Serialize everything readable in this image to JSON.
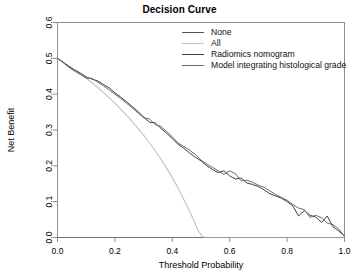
{
  "chart_data": {
    "type": "line",
    "title": "Decision Curve",
    "xlabel": "Threshold Probability",
    "ylabel": "Net Benefit",
    "xlim": [
      0.0,
      1.0
    ],
    "ylim": [
      0.0,
      0.6
    ],
    "xticks": [
      "0.0",
      "0.2",
      "0.4",
      "0.6",
      "0.8",
      "1.0"
    ],
    "xtickvals": [
      0.0,
      0.2,
      0.4,
      0.6,
      0.8,
      1.0
    ],
    "yticks": [
      "0.0",
      "0.1",
      "0.2",
      "0.3",
      "0.4",
      "0.5",
      "0.6"
    ],
    "ytickvals": [
      0.0,
      0.1,
      0.2,
      0.3,
      0.4,
      0.5,
      0.6
    ],
    "grid": false,
    "legend_position": "top-right",
    "series": [
      {
        "name": "None",
        "color": "#555555",
        "width": 1.1,
        "x": [
          0.0,
          1.0
        ],
        "y": [
          0.0,
          0.0
        ]
      },
      {
        "name": "All",
        "color": "#c2c2c2",
        "width": 1.1,
        "x": [
          0.0,
          0.05,
          0.1,
          0.15,
          0.2,
          0.25,
          0.3,
          0.33,
          0.36,
          0.39,
          0.42,
          0.45,
          0.47,
          0.49,
          0.505,
          0.515,
          1.0
        ],
        "y": [
          0.5,
          0.47,
          0.445,
          0.412,
          0.375,
          0.333,
          0.286,
          0.254,
          0.219,
          0.181,
          0.138,
          0.091,
          0.056,
          0.02,
          0.002,
          0.0,
          0.0
        ]
      },
      {
        "name": "Radiomics nomogram",
        "color": "#3f3f3f",
        "width": 1.0,
        "x": [
          0.0,
          0.02,
          0.04,
          0.06,
          0.08,
          0.1,
          0.12,
          0.14,
          0.16,
          0.18,
          0.2,
          0.22,
          0.24,
          0.26,
          0.28,
          0.3,
          0.32,
          0.34,
          0.36,
          0.38,
          0.4,
          0.42,
          0.44,
          0.46,
          0.48,
          0.5,
          0.52,
          0.54,
          0.56,
          0.58,
          0.6,
          0.62,
          0.64,
          0.66,
          0.68,
          0.7,
          0.72,
          0.74,
          0.76,
          0.78,
          0.8,
          0.82,
          0.84,
          0.86,
          0.88,
          0.9,
          0.92,
          0.94,
          0.96,
          0.98,
          1.0
        ],
        "y": [
          0.5,
          0.489,
          0.478,
          0.468,
          0.459,
          0.448,
          0.442,
          0.437,
          0.427,
          0.418,
          0.404,
          0.392,
          0.379,
          0.366,
          0.352,
          0.336,
          0.322,
          0.32,
          0.305,
          0.291,
          0.276,
          0.26,
          0.249,
          0.236,
          0.224,
          0.214,
          0.2,
          0.19,
          0.181,
          0.186,
          0.172,
          0.163,
          0.166,
          0.152,
          0.148,
          0.142,
          0.133,
          0.122,
          0.116,
          0.11,
          0.1,
          0.088,
          0.06,
          0.075,
          0.062,
          0.057,
          0.042,
          0.06,
          0.03,
          0.018,
          0.004
        ]
      },
      {
        "name": "Model integrating histological grade",
        "color": "#6a6a6a",
        "width": 1.0,
        "x": [
          0.0,
          0.02,
          0.04,
          0.06,
          0.08,
          0.1,
          0.12,
          0.14,
          0.16,
          0.18,
          0.2,
          0.22,
          0.24,
          0.26,
          0.28,
          0.3,
          0.32,
          0.34,
          0.36,
          0.38,
          0.4,
          0.42,
          0.44,
          0.46,
          0.48,
          0.5,
          0.52,
          0.54,
          0.56,
          0.58,
          0.6,
          0.62,
          0.64,
          0.66,
          0.68,
          0.7,
          0.72,
          0.74,
          0.76,
          0.78,
          0.8,
          0.82,
          0.84,
          0.86,
          0.88,
          0.9,
          0.92,
          0.94,
          0.96,
          0.98,
          1.0
        ],
        "y": [
          0.5,
          0.488,
          0.475,
          0.464,
          0.455,
          0.445,
          0.444,
          0.434,
          0.423,
          0.412,
          0.4,
          0.388,
          0.375,
          0.362,
          0.348,
          0.334,
          0.331,
          0.315,
          0.31,
          0.296,
          0.281,
          0.264,
          0.254,
          0.244,
          0.232,
          0.216,
          0.205,
          0.196,
          0.186,
          0.176,
          0.186,
          0.178,
          0.158,
          0.16,
          0.154,
          0.146,
          0.14,
          0.13,
          0.12,
          0.112,
          0.104,
          0.092,
          0.082,
          0.078,
          0.056,
          0.062,
          0.055,
          0.04,
          0.036,
          0.024,
          0.002
        ]
      }
    ]
  },
  "legend": {
    "entries": [
      {
        "label": "None",
        "color": "#555555"
      },
      {
        "label": "All",
        "color": "#c2c2c2"
      },
      {
        "label": "Radiomics nomogram",
        "color": "#3f3f3f"
      },
      {
        "label": "Model integrating histological grade",
        "color": "#6a6a6a"
      }
    ]
  }
}
